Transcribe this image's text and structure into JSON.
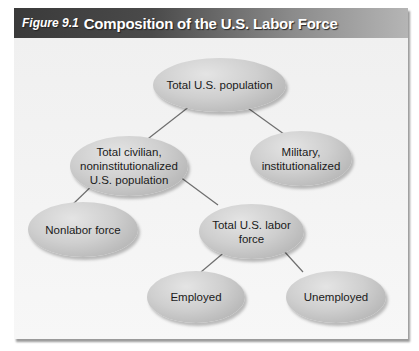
{
  "figure": {
    "number_label": "Figure 9.1",
    "title": "Composition of the U.S. Labor Force",
    "header_color_dark": "#3a3a3a",
    "node_color": "#c8c8c8"
  },
  "nodes": {
    "total_population": "Total U.S. population",
    "civilian": "Total civilian, noninstitutionalized U.S. population",
    "civilian_line1": "Total civilian,",
    "civilian_line2": "noninstitutionalized",
    "civilian_line3": "U.S. population",
    "military": "Military, institutionalized",
    "military_line1": "Military,",
    "military_line2": "institutionalized",
    "nonlabor": "Nonlabor force",
    "labor_force_line1": "Total U.S. labor",
    "labor_force_line2": "force",
    "employed": "Employed",
    "unemployed": "Unemployed"
  },
  "edges": [
    [
      "Total U.S. population",
      "Total civilian, noninstitutionalized U.S. population"
    ],
    [
      "Total U.S. population",
      "Military, institutionalized"
    ],
    [
      "Total civilian, noninstitutionalized U.S. population",
      "Nonlabor force"
    ],
    [
      "Total civilian, noninstitutionalized U.S. population",
      "Total U.S. labor force"
    ],
    [
      "Total U.S. labor force",
      "Employed"
    ],
    [
      "Total U.S. labor force",
      "Unemployed"
    ]
  ]
}
